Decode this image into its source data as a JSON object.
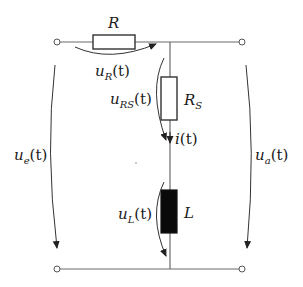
{
  "diagram": {
    "type": "electrical-circuit",
    "components": {
      "R": {
        "label": "R",
        "kind": "resistor"
      },
      "RS": {
        "label": "R",
        "sub": "S",
        "kind": "resistor"
      },
      "L": {
        "label": "L",
        "kind": "inductor"
      }
    },
    "voltages": {
      "uR": {
        "base": "u",
        "sub": "R",
        "arg": "(t)"
      },
      "uRS": {
        "base": "u",
        "sub": "RS",
        "arg": "(t)"
      },
      "uL": {
        "base": "u",
        "sub": "L",
        "arg": "(t)"
      },
      "ue": {
        "base": "u",
        "sub": "e",
        "arg": "(t)"
      },
      "ua": {
        "base": "u",
        "sub": "a",
        "arg": "(t)"
      }
    },
    "currents": {
      "i": {
        "base": "i",
        "arg": "(t)"
      }
    },
    "colors": {
      "wire": "#6a6a6a",
      "component_outline": "#333333",
      "inductor_fill": "#0a0a0a",
      "text": "#1a1a1a",
      "background": "#ffffff"
    }
  }
}
